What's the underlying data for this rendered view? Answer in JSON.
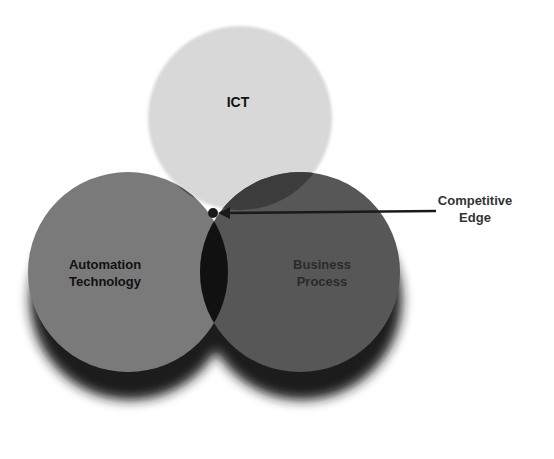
{
  "diagram": {
    "type": "venn",
    "sets": [
      {
        "id": "ict",
        "label": "ICT",
        "fill": "#d8d8d8"
      },
      {
        "id": "automation",
        "label_line1": "Automation",
        "label_line2": "Technology",
        "fill": "#7a7a7a"
      },
      {
        "id": "business",
        "label_line1": "Business",
        "label_line2": "Process",
        "fill": "#555555"
      }
    ],
    "intersections": {
      "ict_automation": "#4a4a4a",
      "ict_business": "#3a3a3a",
      "automation_business": "#111111",
      "all_three": "#ffffff"
    },
    "callout": {
      "label_line1": "Competitive",
      "label_line2": "Edge",
      "points_to": "all_three"
    },
    "shadow_color": "#1a1a1a"
  }
}
